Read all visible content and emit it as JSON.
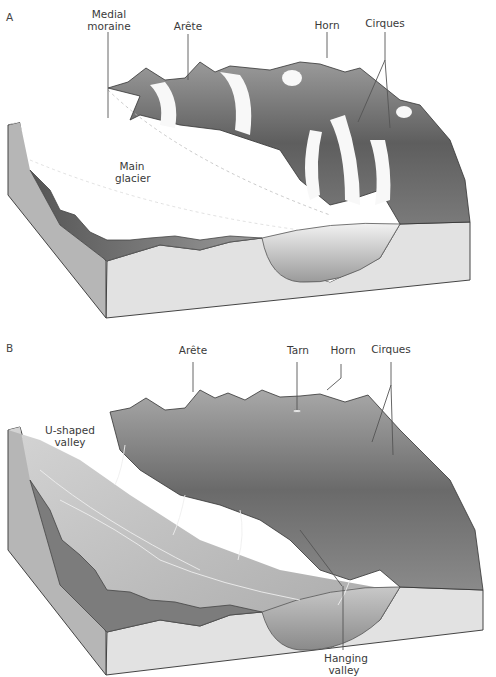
{
  "figure": {
    "panels": [
      {
        "id": "A",
        "letter": "A",
        "labels": {
          "medial_moraine": "Medial\nmoraine",
          "medial_moraine_l1": "Medial",
          "medial_moraine_l2": "moraine",
          "arete": "Arête",
          "horn": "Horn",
          "cirques": "Cirques",
          "main_glacier_l1": "Main",
          "main_glacier_l2": "glacier"
        }
      },
      {
        "id": "B",
        "letter": "B",
        "labels": {
          "u_valley_l1": "U-shaped",
          "u_valley_l2": "valley",
          "arete": "Arête",
          "tarn": "Tarn",
          "horn": "Horn",
          "cirques": "Cirques",
          "hanging_valley_l1": "Hanging",
          "hanging_valley_l2": "valley"
        }
      }
    ],
    "colors": {
      "rock_face": "#e4e4e4",
      "rock_side": "#b4b4b4",
      "ice": "#ffffff",
      "mountain_dark": "#5a5a5a",
      "mountain_mid": "#8c8c8c",
      "leader_line": "#555555"
    }
  }
}
